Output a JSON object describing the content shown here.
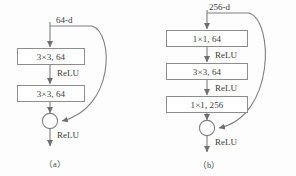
{
  "figure": {
    "background_color": "#fdfdfd",
    "line_color": "#7f7f7f",
    "box_border_color": "#8d8d8d",
    "text_color": "#3b3b3b"
  },
  "diagram_a": {
    "caption": "（a）",
    "input_label": "64-d",
    "blocks": [
      {
        "label": "3×3, 64"
      },
      {
        "label": "3×3, 64"
      }
    ],
    "activations": [
      {
        "label": "ReLU"
      },
      {
        "label": "ReLU"
      }
    ],
    "merge_symbol": "+",
    "shortcut": "identity skip connection"
  },
  "diagram_b": {
    "caption": "（b）",
    "input_label": "256-d",
    "blocks": [
      {
        "label": "1×1, 64"
      },
      {
        "label": "3×3, 64"
      },
      {
        "label": "1×1, 256"
      }
    ],
    "activations": [
      {
        "label": "ReLU"
      },
      {
        "label": "ReLU"
      },
      {
        "label": "ReLU"
      }
    ],
    "merge_symbol": "+",
    "shortcut": "identity skip connection"
  }
}
